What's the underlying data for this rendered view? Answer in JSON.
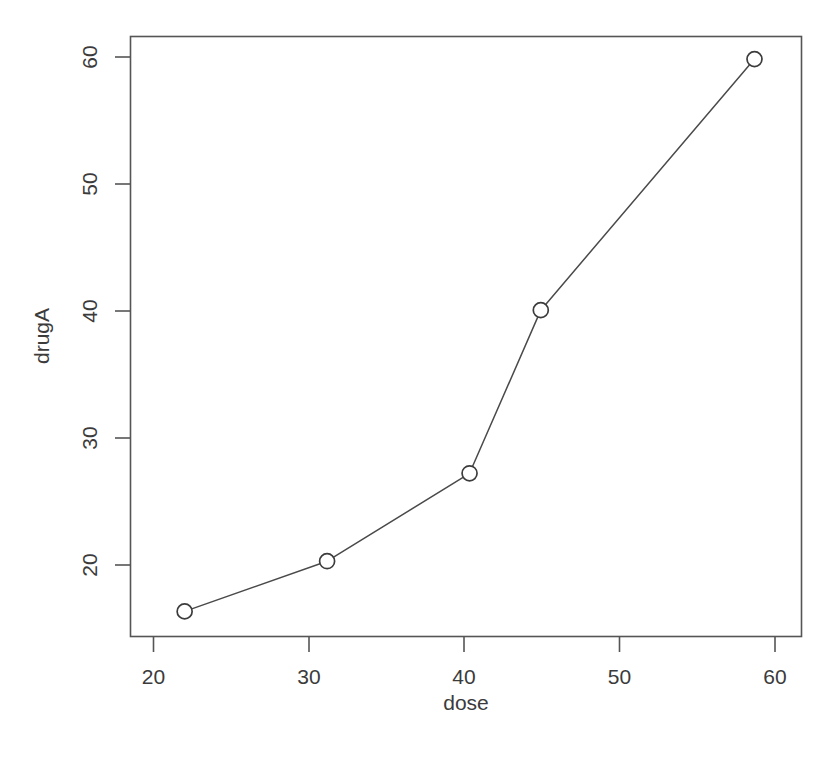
{
  "chart_data": {
    "type": "line",
    "title": "",
    "subtitle": "",
    "xlabel": "dose",
    "ylabel": "drugA",
    "x": [
      20,
      30,
      40,
      45,
      60
    ],
    "values": [
      16,
      20,
      27,
      40,
      60
    ],
    "series": [
      {
        "name": "drugA",
        "x": [
          20,
          30,
          40,
          45,
          60
        ],
        "values": [
          16,
          20,
          27,
          40,
          60
        ]
      }
    ],
    "xlim": [
      16.2,
      63.3
    ],
    "ylim": [
      14.0,
      61.8
    ],
    "xticks": [
      20,
      30,
      40,
      50,
      60
    ],
    "yticks": [
      20,
      30,
      40,
      50,
      60
    ],
    "xtick_labels": [
      "20",
      "30",
      "40",
      "50",
      "60"
    ],
    "ytick_labels": [
      "20",
      "30",
      "40",
      "50",
      "60"
    ],
    "grid": false,
    "legend": false,
    "legend_position": "none",
    "marker": "open-circle",
    "line_color": "#4a4a4a",
    "marker_fill": "#ffffff",
    "marker_stroke": "#3c3c3c",
    "background_color": "#ffffff",
    "axis_color": "#555555",
    "annotations": []
  },
  "axes": {
    "x_title": "dose",
    "y_title": "drugA",
    "x_tick_labels": [
      "20",
      "30",
      "40",
      "50",
      "60"
    ],
    "y_tick_labels": [
      "20",
      "30",
      "40",
      "50",
      "60"
    ]
  }
}
